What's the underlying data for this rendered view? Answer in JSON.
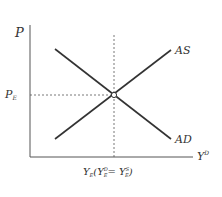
{
  "diagram": {
    "type": "AD-AS equilibrium",
    "axes": {
      "y_label": "P",
      "x_label": "Y",
      "x_label_sup": "D"
    },
    "curves": [
      {
        "name": "AS",
        "label": "AS"
      },
      {
        "name": "AD",
        "label": "AD"
      }
    ],
    "equilibrium": {
      "price_label": "P",
      "price_sub": "E",
      "output_label_main": "Y",
      "output_label_sub": "E",
      "output_label_paren": "(Y",
      "yd_sup": "D",
      "yd_sub": "E",
      "eq": "= Y",
      "ys_sup": "S",
      "ys_sub": "E",
      "close": ")"
    }
  }
}
